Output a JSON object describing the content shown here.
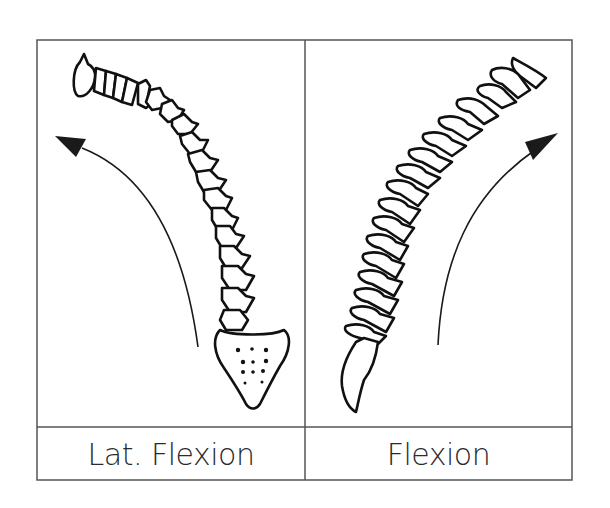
{
  "figure": {
    "panels": [
      {
        "id": "left",
        "caption": "Lat. Flexion",
        "subject": "spine-posterior-view-lateral-bend",
        "arrow_direction": "up-left"
      },
      {
        "id": "right",
        "caption": "Flexion",
        "subject": "spine-lateral-view-forward-bend",
        "arrow_direction": "up-right"
      }
    ],
    "colors": {
      "line": "#1a1a1a",
      "border": "#555555",
      "background": "#ffffff"
    }
  }
}
